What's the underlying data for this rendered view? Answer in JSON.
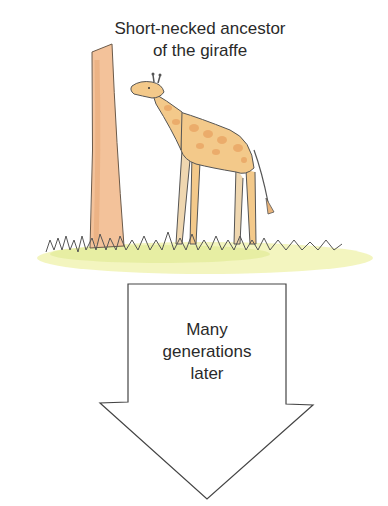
{
  "caption": {
    "line1": "Short-necked ancestor",
    "line2": "of the giraffe"
  },
  "arrow": {
    "line1": "Many",
    "line2": "generations",
    "line3": "later"
  },
  "colors": {
    "giraffe_base": "#f3c98a",
    "giraffe_spots": "#eaa866",
    "tree": "#f0b88a",
    "grass": "#eef1a2",
    "outline": "#555555"
  }
}
